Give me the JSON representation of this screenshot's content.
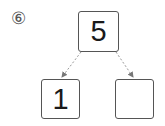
{
  "problem": {
    "number_label": "⑥"
  },
  "number_bond": {
    "whole": "5",
    "parts": [
      "1",
      ""
    ]
  },
  "colors": {
    "border": "#555555",
    "arrow": "#888888",
    "text": "#1a1a1a"
  }
}
